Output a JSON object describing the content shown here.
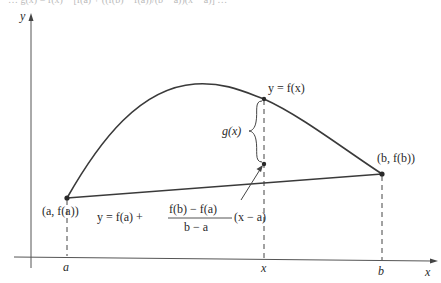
{
  "figure": {
    "cropped_top_text": "…  g(x) = f(x) − [f(a) + ((f(b) − f(a))/(b − a))(x − a)]  …",
    "axes": {
      "x_label": "x",
      "y_label": "y"
    },
    "tick_labels": {
      "a": "a",
      "x": "x",
      "b": "b"
    },
    "points": {
      "start": "(a, f(a))",
      "end": "(b, f(b))"
    },
    "curve_label": "y = f(x)",
    "gap_label": "g(x)",
    "secant_label": {
      "lhs": "y = f(a) +",
      "numerator": "f(b) − f(a)",
      "denominator": "b − a",
      "rhs": "(x − a)"
    },
    "colors": {
      "ink": "#2a2a2a",
      "background": "#ffffff"
    }
  }
}
